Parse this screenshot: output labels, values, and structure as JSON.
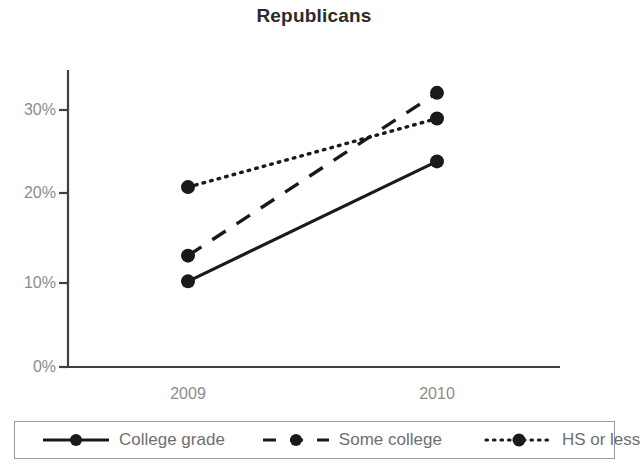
{
  "chart_data": {
    "type": "line",
    "title": "Republicans",
    "subtitle": "",
    "xlabel": "",
    "ylabel": "",
    "categories": [
      "2009",
      "2010"
    ],
    "x": [
      "2009",
      "2010"
    ],
    "ylim": [
      0,
      35
    ],
    "yticks": [
      "0%",
      "10%",
      "20%",
      "30%"
    ],
    "ytick_values": [
      0,
      10,
      20,
      30
    ],
    "grid": false,
    "legend_position": "bottom",
    "series": [
      {
        "name": "College grade",
        "values": [
          10,
          24
        ],
        "labels": [
          "10%",
          "24%"
        ],
        "style": "solid",
        "marker": "circle",
        "color": "#1a1a1a"
      },
      {
        "name": "Some college",
        "values": [
          13,
          32
        ],
        "labels": [
          "13%",
          "32%"
        ],
        "style": "dashed",
        "marker": "circle",
        "color": "#1a1a1a"
      },
      {
        "name": "HS or less",
        "values": [
          21,
          29
        ],
        "labels": [
          "21%",
          "29%"
        ],
        "style": "dotted",
        "marker": "circle",
        "color": "#1a1a1a"
      }
    ],
    "axis_color": "#404040",
    "tick_label_color": "#8c8c8c",
    "title_color": "#2b2b2b",
    "legend_border_color": "#9a9a9a",
    "legend_text_color": "#6f6f6f"
  }
}
